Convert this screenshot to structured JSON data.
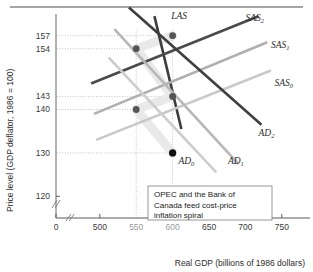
{
  "figure": {
    "top_rule": true,
    "background": "#ffffff"
  },
  "chart_data": {
    "type": "line",
    "title": "",
    "xlabel": "Real GDP (billions of 1986 dollars)",
    "ylabel": "Price level (GDP deflator, 1986 = 100)",
    "xlim": [
      0,
      775
    ],
    "ylim": [
      115,
      162
    ],
    "axis_break_x": true,
    "axis_break_y": true,
    "grid": false,
    "xticks": [
      {
        "value": 0,
        "label": "0",
        "muted": false
      },
      {
        "value": 500,
        "label": "500",
        "muted": false
      },
      {
        "value": 550,
        "label": "550",
        "muted": true
      },
      {
        "value": 600,
        "label": "600",
        "muted": true
      },
      {
        "value": 650,
        "label": "650",
        "muted": false
      },
      {
        "value": 700,
        "label": "700",
        "muted": false
      },
      {
        "value": 750,
        "label": "750",
        "muted": false
      }
    ],
    "yticks": [
      {
        "value": 157,
        "label": "157"
      },
      {
        "value": 154,
        "label": "154"
      },
      {
        "value": 143,
        "label": "143"
      },
      {
        "value": 140,
        "label": "140"
      },
      {
        "value": 130,
        "label": "130"
      },
      {
        "value": 120,
        "label": "120"
      }
    ],
    "series": [
      {
        "name": "LAS",
        "label": "LAS",
        "sub": "",
        "kind": "vertical-ish",
        "color": "#3c3c3c",
        "width": 2.6,
        "points": [
          [
            575,
            161.5
          ],
          [
            612,
            135.5
          ]
        ],
        "label_pos": [
          598,
          160.8
        ]
      },
      {
        "name": "SAS0",
        "label": "SAS",
        "sub": "0",
        "kind": "upward",
        "color": "#c9c9c9",
        "width": 2.6,
        "points": [
          [
            495,
            133.0
          ],
          [
            735,
            149.0
          ]
        ],
        "label_pos": [
          740,
          145.5
        ]
      },
      {
        "name": "SAS1",
        "label": "SAS",
        "sub": "1",
        "kind": "upward",
        "color": "#b0b0b0",
        "width": 2.6,
        "points": [
          [
            492,
            139.0
          ],
          [
            730,
            155.5
          ]
        ],
        "label_pos": [
          735,
          154.2
        ]
      },
      {
        "name": "SAS2",
        "label": "SAS",
        "sub": "2",
        "kind": "upward",
        "color": "#4a4a4a",
        "width": 2.6,
        "points": [
          [
            488,
            146.0
          ],
          [
            718,
            161.5
          ]
        ],
        "label_pos": [
          700,
          160.5
        ]
      },
      {
        "name": "AD0",
        "label": "AD",
        "sub": "0",
        "kind": "downward",
        "color": "#cdcdcd",
        "width": 2.6,
        "points": [
          [
            512,
            152.0
          ],
          [
            660,
            125.5
          ]
        ],
        "label_pos": [
          608,
          127.5
        ]
      },
      {
        "name": "AD1",
        "label": "AD",
        "sub": "1",
        "kind": "downward",
        "color": "#b7b7b7",
        "width": 2.6,
        "points": [
          [
            520,
            158.5
          ],
          [
            690,
            127.5
          ]
        ],
        "label_pos": [
          676,
          127.5
        ]
      },
      {
        "name": "AD2",
        "label": "AD",
        "sub": "2",
        "kind": "downward",
        "color": "#3f3f3f",
        "width": 2.6,
        "points": [
          [
            540,
            163.5
          ],
          [
            722,
            136.5
          ]
        ],
        "label_pos": [
          718,
          134.0
        ]
      }
    ],
    "equilibria": [
      {
        "name": "eq-157-600",
        "x": 600,
        "y": 157,
        "color": "#555555",
        "radius": 3.4,
        "guide": true
      },
      {
        "name": "eq-154-550",
        "x": 550,
        "y": 154,
        "color": "#555555",
        "radius": 3.4,
        "guide": true
      },
      {
        "name": "eq-143-600",
        "x": 600,
        "y": 143,
        "color": "#555555",
        "radius": 3.4,
        "guide": true
      },
      {
        "name": "eq-140-550",
        "x": 550,
        "y": 140,
        "color": "#555555",
        "radius": 3.4,
        "guide": true
      },
      {
        "name": "eq-130-600",
        "x": 600,
        "y": 130,
        "color": "#111111",
        "radius": 3.6,
        "guide": true
      }
    ],
    "vertical_guides": [
      550,
      600
    ],
    "annotation": {
      "lines": [
        "OPEC and the Bank of",
        "Canada feed cost-price",
        "inflation spiral"
      ],
      "border_color": "#8d8d8d",
      "background": "#ffffff"
    }
  }
}
